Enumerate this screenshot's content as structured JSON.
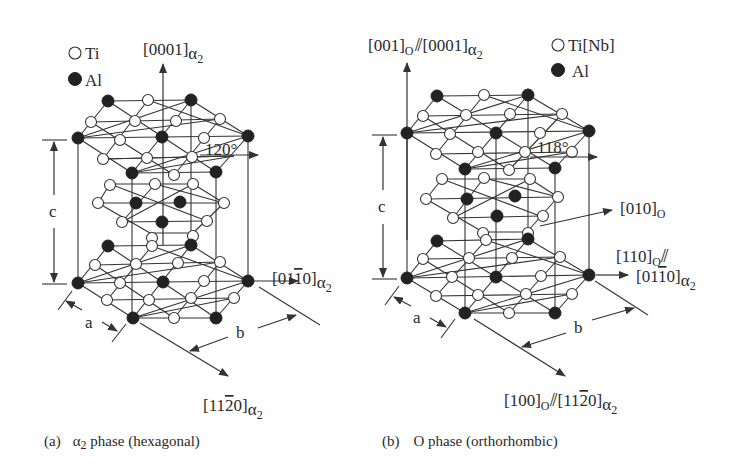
{
  "figure": {
    "panels": [
      {
        "id": "a",
        "caption_letter": "(a)",
        "caption_text": "α₂ phase (hexagonal)",
        "caption_greek": "α",
        "caption_sub": "2",
        "caption_rest": " phase (hexagonal)",
        "legend": [
          {
            "symbol": "open-circle",
            "label": "Ti"
          },
          {
            "symbol": "filled-circle",
            "label": "Al"
          }
        ],
        "axes": {
          "vertical": {
            "main": "[0001]",
            "sub": "α",
            "sub2": "2"
          },
          "horizontal": {
            "main": "[01",
            "bar": "1",
            "tail": "0]",
            "sub": "α",
            "sub2": "2"
          },
          "diagonal": {
            "main": "[11",
            "bar": "2",
            "tail": "0]",
            "sub": "α",
            "sub2": "2"
          }
        },
        "angle": "120°",
        "dims": {
          "c": "c",
          "a": "a",
          "b": "b"
        }
      },
      {
        "id": "b",
        "caption_letter": "(b)",
        "caption_text": "O phase (orthorhombic)",
        "caption_rest": "O phase (orthorhombic)",
        "legend": [
          {
            "symbol": "open-circle",
            "label": "Ti[Nb]"
          },
          {
            "symbol": "filled-circle",
            "label": "Al"
          }
        ],
        "axes": {
          "vertical": {
            "main": "[001]",
            "sub": "O",
            "par": "⫽",
            "main2": "[0001]",
            "sub2a": "α",
            "sub2b": "2"
          },
          "horizontal": {
            "line1_main": "[110]",
            "line1_sub": "O",
            "par": "⫽",
            "main": "[01",
            "bar": "1",
            "tail": "0]",
            "sub": "α",
            "sub2": "2"
          },
          "diagonal": {
            "main": "[100]",
            "sub": "O",
            "par": "⫽",
            "main2": "[11",
            "bar": "2",
            "tail": "0]",
            "sub2a": "α",
            "sub2b": "2"
          },
          "inclined": {
            "main": "[010]",
            "sub": "O"
          }
        },
        "angle": "118°",
        "dims": {
          "c": "c",
          "a": "a",
          "b": "b"
        }
      }
    ]
  }
}
